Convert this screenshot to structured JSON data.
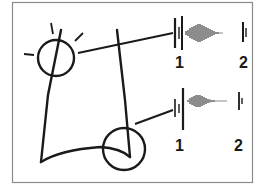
{
  "figure": {
    "colors": {
      "stroke": "#1a1a1a",
      "frame": "#8a8a8a",
      "background": "#ffffff"
    },
    "traces": [
      {
        "id": "upper",
        "start_label": "1",
        "end_label": "2"
      },
      {
        "id": "lower",
        "start_label": "1",
        "end_label": "2"
      }
    ]
  }
}
